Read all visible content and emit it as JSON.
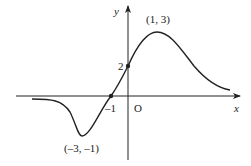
{
  "diagram": {
    "type": "function-graph",
    "axes": {
      "x_label": "x",
      "y_label": "y",
      "origin_label": "O"
    },
    "points": [
      {
        "label": "(1, 3)",
        "x": 1,
        "y": 3,
        "kind": "maximum"
      },
      {
        "label": "(–3, –1)",
        "x": -3,
        "y": -1,
        "kind": "minimum"
      },
      {
        "label": "2",
        "x": 0,
        "y": 2,
        "kind": "y-intercept"
      },
      {
        "label": "–1",
        "x": -1,
        "y": 0,
        "kind": "x-intercept"
      }
    ],
    "colors": {
      "stroke": "#222222",
      "background": "#ffffff"
    }
  }
}
